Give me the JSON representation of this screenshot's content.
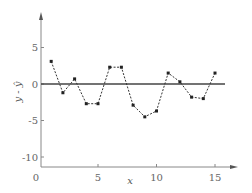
{
  "chart_data": {
    "type": "line",
    "title": "",
    "xlabel": "x",
    "ylabel": "y - ŷ",
    "xlim": [
      0,
      16.5
    ],
    "ylim": [
      -11,
      9
    ],
    "xticks": [
      0,
      5,
      10,
      15
    ],
    "xtick_labels": [
      "0",
      "5",
      "10",
      "15"
    ],
    "yticks": [
      5,
      0,
      -5,
      -10
    ],
    "ytick_labels": [
      "5",
      "0",
      "-5",
      "-10"
    ],
    "grid": false,
    "legend": null,
    "reference_line": {
      "y": 0,
      "style": "solid"
    },
    "series": [
      {
        "name": "residuals",
        "style": "dashed",
        "marker": "square",
        "x": [
          1,
          2,
          3,
          4,
          5,
          6,
          7,
          8,
          9,
          10,
          11,
          12,
          13,
          14,
          15
        ],
        "y": [
          3.1,
          -1.2,
          0.7,
          -2.7,
          -2.7,
          2.3,
          2.3,
          -2.9,
          -4.5,
          -3.7,
          1.5,
          0.3,
          -1.8,
          -2.0,
          1.5
        ]
      }
    ]
  },
  "colors": {
    "axis": "#888888",
    "zero_line": "#444444",
    "series": "#333333"
  }
}
